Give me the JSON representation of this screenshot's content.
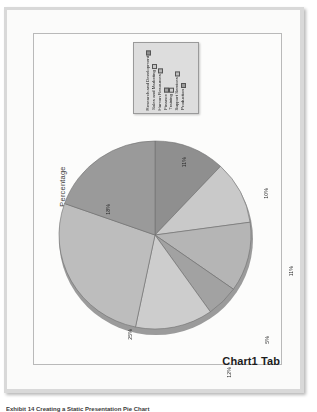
{
  "document": {
    "chart_tab_label": "Chart1 Tab",
    "footer_caption": "Exhibit 14 Creating a Static Presentation Pie Chart"
  },
  "chart_frame": {
    "axis_title": "Percentage"
  },
  "legend": {
    "items": [
      {
        "label": "Research and Development",
        "color": "#8f8f8f"
      },
      {
        "label": "Sales and Marketing",
        "color": "#c9c9c9"
      },
      {
        "label": "Human Resources",
        "color": "#b5b5b5"
      },
      {
        "label": "Finance",
        "color": "#a2a2a2"
      },
      {
        "label": "Training",
        "color": "#cdcdcd"
      },
      {
        "label": "Support Services",
        "color": "#bdbdbd"
      },
      {
        "label": "Production",
        "color": "#9a9a9a"
      }
    ]
  },
  "chart_data": {
    "type": "pie",
    "title": "",
    "subtitle": "",
    "xlabel": "",
    "ylabel": "Percentage",
    "legend_position": "top",
    "grid": false,
    "categories": [
      "Research and Development",
      "Sales and Marketing",
      "Human Resources",
      "Finance",
      "Training",
      "Support Services",
      "Production"
    ],
    "values": [
      11,
      10,
      11,
      5,
      12,
      25,
      18
    ],
    "data_labels": [
      "11%",
      "10%",
      "11%",
      "5%",
      "12%",
      "25%",
      "18%"
    ],
    "colors": [
      "#8f8f8f",
      "#c9c9c9",
      "#b5b5b5",
      "#a2a2a2",
      "#cdcdcd",
      "#bdbdbd",
      "#9a9a9a"
    ],
    "label_positions": [
      {
        "text": "11%",
        "x": 148,
        "y": 123
      },
      {
        "text": "10%",
        "x": 230,
        "y": 154
      },
      {
        "text": "11%",
        "x": 255,
        "y": 232
      },
      {
        "text": "5%",
        "x": 231,
        "y": 302
      },
      {
        "text": "12%",
        "x": 193,
        "y": 333
      },
      {
        "text": "25%",
        "x": 94,
        "y": 295
      },
      {
        "text": "18%",
        "x": 72,
        "y": 170
      }
    ]
  }
}
